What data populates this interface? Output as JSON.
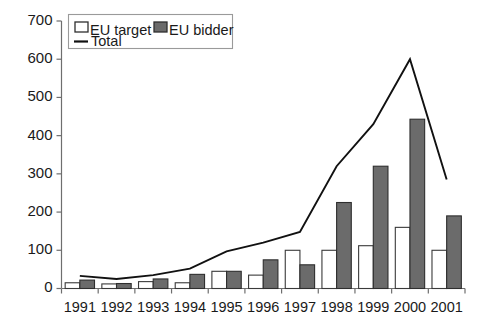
{
  "chart_data": {
    "type": "bar",
    "title": "",
    "subtitle": "",
    "xlabel": "",
    "ylabel": "",
    "categories": [
      "1991",
      "1992",
      "1993",
      "1994",
      "1995",
      "1996",
      "1997",
      "1998",
      "1999",
      "2000",
      "2001"
    ],
    "series": [
      {
        "name": "EU target",
        "type": "bar",
        "fill": "#ffffff",
        "values": [
          15,
          12,
          18,
          15,
          45,
          35,
          100,
          100,
          112,
          160,
          100
        ]
      },
      {
        "name": "EU bidder",
        "type": "bar",
        "fill": "#6b6b6b",
        "values": [
          22,
          13,
          25,
          37,
          45,
          75,
          62,
          225,
          320,
          443,
          190
        ]
      },
      {
        "name": "Total",
        "type": "line",
        "stroke": "#111111",
        "values": [
          33,
          25,
          35,
          52,
          97,
          120,
          148,
          320,
          430,
          600,
          285
        ]
      }
    ],
    "ylim": [
      0,
      700
    ],
    "y_ticks": [
      0,
      100,
      200,
      300,
      400,
      500,
      600,
      700
    ],
    "y_tick_labels": [
      "0",
      "100",
      "200",
      "300",
      "400",
      "500",
      "600",
      "700"
    ],
    "grid": false,
    "legend_position": "top-left",
    "legend_entries": [
      {
        "label": "EU target",
        "marker": "filled-square-white"
      },
      {
        "label": "EU bidder",
        "marker": "filled-square-gray"
      },
      {
        "label": "Total",
        "marker": "line"
      }
    ]
  },
  "colors": {
    "bidder_gray": "#6b6b6b",
    "target_white": "#ffffff",
    "line_black": "#111111",
    "axis_gray": "#6e6e6e",
    "text": "#1a1a1a"
  }
}
